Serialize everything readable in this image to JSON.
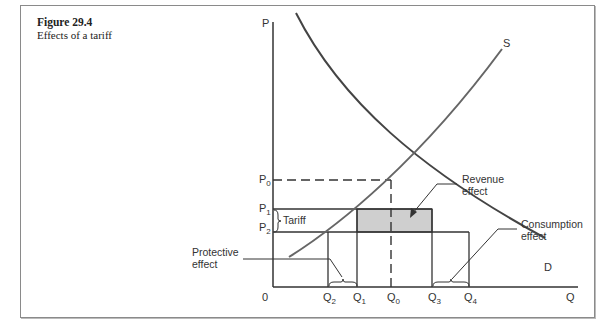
{
  "caption": {
    "title": "Figure 29.4",
    "subtitle": "Effects of a tariff"
  },
  "axes": {
    "y_label": "P",
    "x_label": "Q",
    "origin": "0"
  },
  "curves": {
    "supply": "S",
    "demand": "D"
  },
  "price_labels": [
    "P",
    "P",
    "P"
  ],
  "price_subs": [
    "0",
    "1",
    "2"
  ],
  "qty_labels": [
    "Q",
    "Q",
    "Q",
    "Q",
    "Q"
  ],
  "qty_subs": [
    "2",
    "1",
    "0",
    "3",
    "4"
  ],
  "annotations": {
    "tariff": "Tariff",
    "revenue_1": "Revenue",
    "revenue_2": "effect",
    "consumption_1": "Consumption",
    "consumption_2": "effect",
    "protective_1": "Protective",
    "protective_2": "effect"
  },
  "colors": {
    "line": "#333333",
    "shade": "#cfcfcf",
    "supply": "#666666"
  }
}
